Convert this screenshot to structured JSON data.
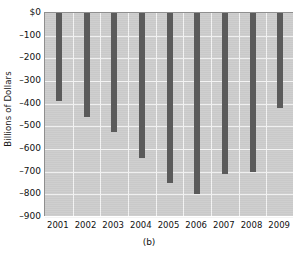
{
  "chart_data": {
    "type": "bar",
    "title": "",
    "subtitle": "",
    "caption": "(b)",
    "xlabel": "",
    "ylabel": "Billions of Dollars",
    "categories": [
      "2001",
      "2002",
      "2003",
      "2004",
      "2005",
      "2006",
      "2007",
      "2008",
      "2009"
    ],
    "values": [
      -390,
      -460,
      -525,
      -640,
      -750,
      -800,
      -710,
      -700,
      -420
    ],
    "ylim": [
      -900,
      0
    ],
    "yticks": [
      0,
      -100,
      -200,
      -300,
      -400,
      -500,
      -600,
      -700,
      -800,
      -900
    ],
    "ytick_labels": [
      "$0",
      "–100",
      "–200",
      "–300",
      "–400",
      "–500",
      "–600",
      "–700",
      "–800",
      "–900"
    ],
    "grid": true,
    "legend": [],
    "legend_position": "none",
    "bar_color": "#5b5b5b",
    "plot_background": "#cdcdcd",
    "grid_color": "#f4f4f4",
    "annotations": []
  }
}
